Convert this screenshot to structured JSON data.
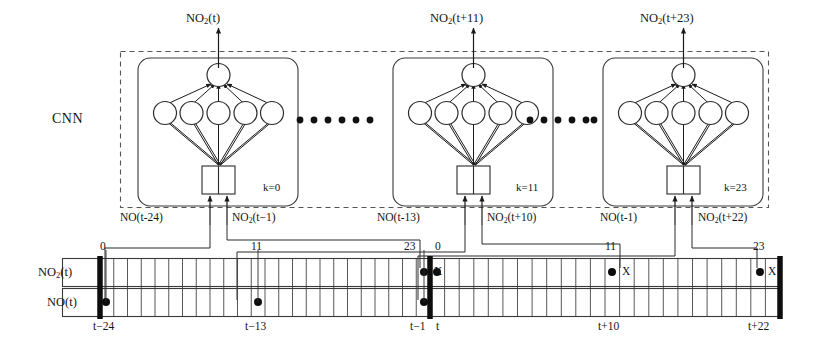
{
  "figure": {
    "type": "architecture-diagram",
    "group_label": "CNN",
    "ellipsis_dots": 6
  },
  "cnn_blocks": [
    {
      "id": "block-k0",
      "k_label": "k=0",
      "output_label_html": "NO<sub>2</sub>(t)",
      "output_label_text": "NO2(t)",
      "input_left_html": "NO(t−24)",
      "input_left_text": "NO(t-24)",
      "input_right_html": "NO<sub>2</sub>(t−1)",
      "input_right_text": "NO2(t-1)",
      "hidden_nodes": 5,
      "output_nodes": 1,
      "input_cells": 2
    },
    {
      "id": "block-k11",
      "k_label": "k=11",
      "output_label_html": "NO<sub>2</sub>(t+11)",
      "output_label_text": "NO2(t+11)",
      "input_left_html": "NO(t−13)",
      "input_left_text": "NO(t-13)",
      "input_right_html": "NO<sub>2</sub>(t+10)",
      "input_right_text": "NO2(t+10)",
      "hidden_nodes": 5,
      "output_nodes": 1,
      "input_cells": 2
    },
    {
      "id": "block-k23",
      "k_label": "k=23",
      "output_label_html": "NO<sub>2</sub>(t+23)",
      "output_label_text": "NO2(t+23)",
      "input_left_html": "NO(t−1)",
      "input_left_text": "NO(t-1)",
      "input_right_html": "NO<sub>2</sub>(t+22)",
      "input_right_text": "NO2(t+22)",
      "hidden_nodes": 5,
      "output_nodes": 1,
      "input_cells": 2
    }
  ],
  "timeline": {
    "rows": [
      {
        "id": "row-no2",
        "label_html": "NO<sub>2</sub>(t)",
        "label_text": "NO2(t)"
      },
      {
        "id": "row-no",
        "label_html": "NO(t)",
        "label_text": "NO(t)"
      }
    ],
    "past_segment": {
      "cells": 24,
      "start_tick": "t−24",
      "end_tick": "t−1"
    },
    "future_segment": {
      "cells": 24,
      "start_tick": "t",
      "mid_tick": "t+10",
      "end_tick": "t+22"
    },
    "index_markers": [
      {
        "id": "idx-past-0",
        "text": "0"
      },
      {
        "id": "idx-past-11",
        "text": "11"
      },
      {
        "id": "idx-past-23",
        "text": "23"
      },
      {
        "id": "idx-fut-0",
        "text": "0"
      },
      {
        "id": "idx-fut-11",
        "text": "11"
      },
      {
        "id": "idx-fut-23",
        "text": "23"
      }
    ],
    "tick_labels": [
      {
        "id": "tick-t-24",
        "text": "t−24"
      },
      {
        "id": "tick-t-13",
        "text": "t−13"
      },
      {
        "id": "tick-t-1",
        "text": "t−1"
      },
      {
        "id": "tick-t",
        "text": "t"
      },
      {
        "id": "tick-t10",
        "text": "t+10"
      },
      {
        "id": "tick-t22",
        "text": "t+22"
      }
    ],
    "predicted_markers": [
      {
        "id": "pred-0",
        "text": "X"
      },
      {
        "id": "pred-11",
        "text": "X"
      },
      {
        "id": "pred-23",
        "text": "X"
      }
    ],
    "separator_count": 3
  },
  "colors": {
    "ink": "#1a1a1a",
    "line": "#2b2b2b",
    "grid": "#3a3a3a",
    "dashed": "#555555",
    "background": "#ffffff"
  }
}
